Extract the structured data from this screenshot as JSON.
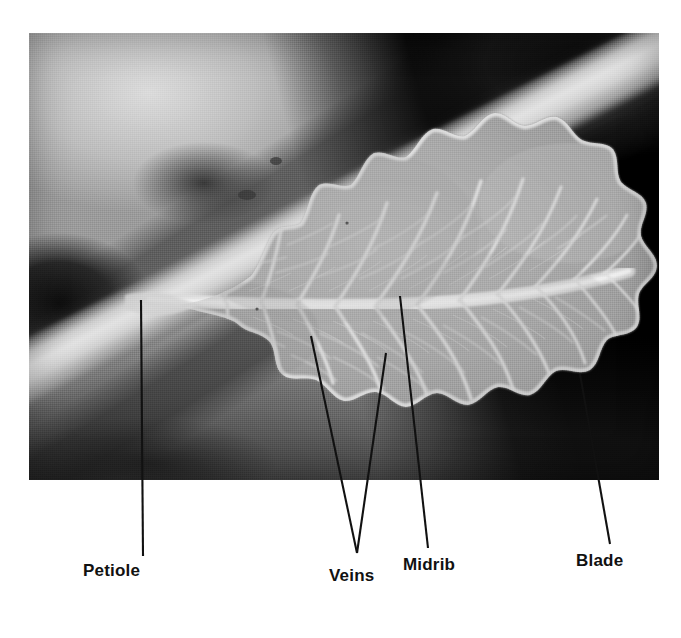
{
  "figure": {
    "kind": "labeled-photograph",
    "background_color": "#ffffff",
    "photo": {
      "frame": {
        "x": 29,
        "y": 33,
        "width": 630,
        "height": 447
      },
      "style": "black-and-white halftone photograph",
      "dark_background_color": "#000000",
      "leaf_color": "#a8a8a8",
      "vein_color": "#e3e3e3"
    }
  },
  "callouts": [
    {
      "id": "petiole",
      "label": "Petiole",
      "leader": {
        "x1": 141,
        "y1": 300,
        "x2": 143,
        "y2": 556
      },
      "label_pos": {
        "x": 83,
        "y": 561
      }
    },
    {
      "id": "veins",
      "label": "Veins",
      "leader_points": [
        {
          "x1": 311,
          "y1": 336,
          "x2": 357,
          "y2": 553
        },
        {
          "x1": 386,
          "y1": 353,
          "x2": 357,
          "y2": 553
        }
      ],
      "label_pos": {
        "x": 329,
        "y": 566
      }
    },
    {
      "id": "midrib",
      "label": "Midrib",
      "leader": {
        "x1": 400,
        "y1": 296,
        "x2": 428,
        "y2": 548
      },
      "label_pos": {
        "x": 403,
        "y": 555
      }
    },
    {
      "id": "blade",
      "label": "Blade",
      "leader": {
        "x1": 580,
        "y1": 374,
        "x2": 610,
        "y2": 544
      },
      "label_pos": {
        "x": 576,
        "y": 551
      }
    }
  ],
  "colors": {
    "leader_line": "#111111",
    "label_text": "#111111",
    "page": "#ffffff"
  }
}
